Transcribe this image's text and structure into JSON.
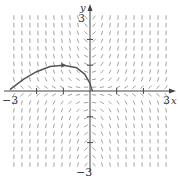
{
  "figure": {
    "type": "direction-field",
    "x_label": "x",
    "y_label": "y",
    "x_min_label": "−3",
    "x_max_label": "3",
    "y_min_label": "−3",
    "y_max_label": "3",
    "colors": {
      "axis": "#444444",
      "field": "#8a8a8a",
      "curve": "#555555"
    }
  },
  "chart_data": {
    "type": "line",
    "title": "",
    "xlabel": "x",
    "ylabel": "y",
    "xlim": [
      -3,
      3
    ],
    "ylim": [
      -3,
      3
    ],
    "grid": false,
    "x_ticks": [
      -3,
      -2,
      -1,
      1,
      2,
      3
    ],
    "y_ticks": [
      -3,
      -2,
      -1,
      1,
      2,
      3
    ],
    "series": [
      {
        "name": "solution curve",
        "x": [
          -3,
          -2.5,
          -2,
          -1.5,
          -1,
          -0.5,
          -0.2,
          0,
          0.05,
          0.1
        ],
        "y": [
          0.05,
          0.45,
          0.75,
          0.95,
          1.0,
          0.9,
          0.65,
          0.3,
          0.1,
          0.0
        ]
      }
    ],
    "annotations": [
      "direction arrow on curve near (-1, 1)"
    ]
  }
}
